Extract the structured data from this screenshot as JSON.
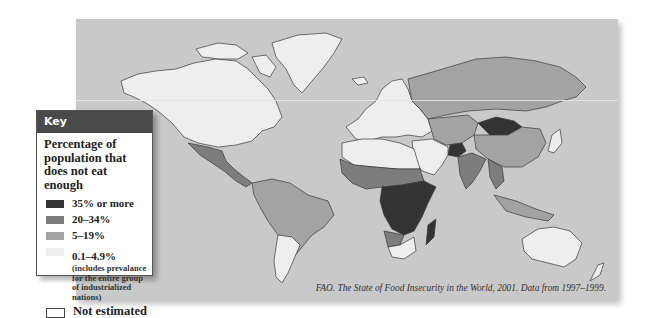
{
  "map": {
    "title": "World map of undernourishment",
    "source": "FAO. The State of Food Insecurity in the World, 2001. Data from 1997–1999.",
    "colors": {
      "ocean": "#c9c9c9",
      "level_35_plus": "#333333",
      "level_20_34": "#7d7d7d",
      "level_5_19": "#a3a3a3",
      "level_0_1_4_9": "#eeeeee",
      "not_estimated": "#ffffff"
    }
  },
  "legend": {
    "header": "Key",
    "title": "Percentage of population that does not eat enough",
    "items": [
      {
        "label": "35% or more",
        "color": "#333333"
      },
      {
        "label": "20–34%",
        "color": "#7d7d7d"
      },
      {
        "label": "5–19%",
        "color": "#a3a3a3"
      },
      {
        "label": "0.1–4.9%",
        "color": "#eeeeee",
        "note": "(includes prevalance for the entire group of industrialized nations)"
      },
      {
        "label": "Not estimated",
        "color": "#ffffff"
      }
    ]
  },
  "regions": [
    {
      "name": "North America",
      "category": "0.1–4.9%"
    },
    {
      "name": "Greenland",
      "category": "0.1–4.9%"
    },
    {
      "name": "Central America",
      "category": "20–34%"
    },
    {
      "name": "South America (north)",
      "category": "5–19%"
    },
    {
      "name": "Argentina / Chile",
      "category": "0.1–4.9%"
    },
    {
      "name": "Europe",
      "category": "0.1–4.9%"
    },
    {
      "name": "Russia",
      "category": "5–19%"
    },
    {
      "name": "North Africa",
      "category": "0.1–4.9%"
    },
    {
      "name": "West Africa",
      "category": "20–34%"
    },
    {
      "name": "Central & East Africa",
      "category": "35% or more"
    },
    {
      "name": "South Africa",
      "category": "0.1–4.9%"
    },
    {
      "name": "Madagascar",
      "category": "35% or more"
    },
    {
      "name": "Middle East",
      "category": "0.1–4.9%"
    },
    {
      "name": "Central Asia",
      "category": "5–19%"
    },
    {
      "name": "Mongolia",
      "category": "35% or more"
    },
    {
      "name": "Afghanistan",
      "category": "35% or more"
    },
    {
      "name": "China",
      "category": "5–19%"
    },
    {
      "name": "India",
      "category": "20–34%"
    },
    {
      "name": "Southeast Asia",
      "category": "20–34%"
    },
    {
      "name": "Japan",
      "category": "0.1–4.9%"
    },
    {
      "name": "Australia",
      "category": "0.1–4.9%"
    },
    {
      "name": "New Zealand",
      "category": "0.1–4.9%"
    }
  ]
}
